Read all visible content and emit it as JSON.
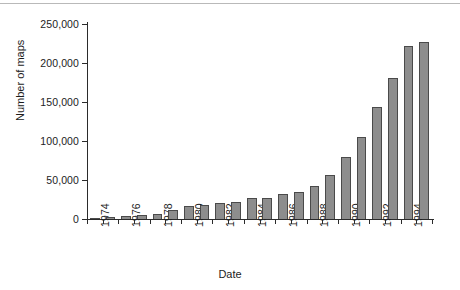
{
  "chart_data": {
    "type": "bar",
    "title": "",
    "xlabel": "Date",
    "ylabel": "Number of maps",
    "categories": [
      "1974",
      "1975",
      "1976",
      "1977",
      "1978",
      "1979",
      "1980",
      "1981",
      "1982",
      "1983",
      "1984",
      "1985",
      "1986",
      "1987",
      "1988",
      "1989",
      "1990",
      "1991",
      "1992",
      "1993",
      "1994",
      "1995"
    ],
    "values": [
      1000,
      2500,
      3500,
      5500,
      7000,
      11000,
      17000,
      18500,
      20500,
      22000,
      26500,
      27000,
      31500,
      34500,
      42000,
      56000,
      79000,
      105000,
      143000,
      181000,
      222000,
      227000
    ],
    "x_tick_labels": [
      "1974",
      "1976",
      "1978",
      "1980",
      "1982",
      "1984",
      "1986",
      "1988",
      "1990",
      "1992",
      "1994"
    ],
    "y_tick_labels": [
      "0",
      "50,000",
      "100,000",
      "150,000",
      "200,000",
      "250,000"
    ],
    "y_tick_values": [
      0,
      50000,
      100000,
      150000,
      200000,
      250000
    ],
    "ylim": [
      0,
      250000
    ],
    "xlim": [
      "1974",
      "1995"
    ],
    "grid": false,
    "legend": null,
    "bar_color": "#8d8d8d",
    "bar_edge_color": "#4a4a4a",
    "axis_color": "#2b2b2b",
    "background_color": "#ffffff"
  }
}
